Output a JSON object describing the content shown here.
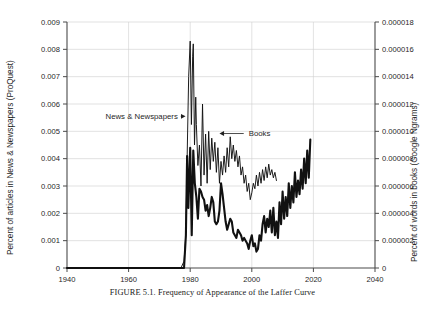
{
  "caption": {
    "lead": "FIGURE 5.1.",
    "text": " Frequency of Appearance of the Laffer Curve"
  },
  "chart_data": {
    "type": "line",
    "title": "Frequency of Appearance of the Laffer Curve",
    "xlabel": "",
    "ylabel": "Percent of articles in News & Newspapers (ProQuest)",
    "y2label": "Percent of words in books (Google Ngrams)",
    "xlim": [
      1940,
      2040
    ],
    "ylim": [
      0,
      0.009
    ],
    "y2lim": [
      0,
      1.8e-05
    ],
    "grid": true,
    "legend_position": "inline-annotations",
    "x_ticks": [
      1940,
      1960,
      1980,
      2000,
      2020,
      2040
    ],
    "x_tick_labels": [
      "1940",
      "1960",
      "1980",
      "2000",
      "2020",
      "2040"
    ],
    "y_ticks": [
      0,
      0.001,
      0.002,
      0.003,
      0.004,
      0.005,
      0.006,
      0.007,
      0.008,
      0.009
    ],
    "y_tick_labels": [
      "0",
      "0.001",
      "0.002",
      "0.003",
      "0.004",
      "0.005",
      "0.006",
      "0.007",
      "0.008",
      "0.009"
    ],
    "y2_ticks": [
      0,
      2e-06,
      4e-06,
      6e-06,
      8e-06,
      1e-05,
      1.2e-05,
      1.4e-05,
      1.6e-05,
      1.8e-05
    ],
    "y2_tick_labels": [
      "0",
      "0.000002",
      "0.000004",
      "0.000006",
      "0.000008",
      "0.000010",
      "0.000012",
      "0.000014",
      "0.000016",
      "0.000018"
    ],
    "annotations": [
      {
        "label": "News & Newspapers",
        "text_x": 1952.5,
        "text_y": 0.00555,
        "arrow_to_x": 1978.5,
        "arrow_to_y": 0.00555
      },
      {
        "label": "Books",
        "text_x": 1999.0,
        "text_y": 0.00492,
        "arrow_to_x": 1989.5,
        "arrow_to_y": 0.00492
      }
    ],
    "series": [
      {
        "name": "News & Newspapers",
        "axis": "left",
        "color": "#111111",
        "width": 2.1,
        "x": [
          1940,
          1945,
          1950,
          1955,
          1960,
          1965,
          1970,
          1974,
          1976,
          1977,
          1978,
          1978.6,
          1979,
          1979.4,
          1980,
          1980.5,
          1981,
          1981.5,
          1982,
          1982.5,
          1983,
          1983.5,
          1984,
          1984.5,
          1985,
          1985.5,
          1986,
          1986.5,
          1987,
          1987.5,
          1988,
          1988.5,
          1989,
          1989.5,
          1990,
          1990.5,
          1991,
          1991.5,
          1992,
          1992.5,
          1993,
          1993.5,
          1994,
          1994.5,
          1995,
          1995.5,
          1996,
          1996.5,
          1997,
          1997.5,
          1998,
          1998.5,
          1999,
          1999.5,
          2000,
          2000.5,
          2001,
          2001.5,
          2002,
          2002.5,
          2003,
          2003.5,
          2004,
          2004.5,
          2005,
          2005.5,
          2006,
          2006.5,
          2007,
          2007.5,
          2008,
          2008.5,
          2009,
          2009.5,
          2010,
          2010.5,
          2011,
          2011.5,
          2012,
          2012.5,
          2013,
          2013.5,
          2014,
          2014.5,
          2015,
          2015.5,
          2016,
          2016.5,
          2017,
          2017.5,
          2018,
          2018.5,
          2019
        ],
        "y": [
          0,
          0,
          0,
          0,
          0,
          0,
          0,
          0,
          0,
          0,
          0,
          0.0012,
          0.0041,
          0.0022,
          0.0044,
          0.0012,
          0.0043,
          0.0031,
          0.0026,
          0.0018,
          0.0029,
          0.0028,
          0.0026,
          0.0025,
          0.0021,
          0.0023,
          0.0019,
          0.0022,
          0.0026,
          0.0024,
          0.0017,
          0.0016,
          0.0017,
          0.0021,
          0.0031,
          0.0027,
          0.0022,
          0.0017,
          0.0014,
          0.0016,
          0.0018,
          0.0017,
          0.0013,
          0.0012,
          0.0011,
          0.0014,
          0.0013,
          0.0012,
          0.001,
          0.0011,
          0.001,
          0.0009,
          0.0007,
          0.001,
          0.0012,
          0.0008,
          0.0009,
          0.0006,
          0.0007,
          0.0012,
          0.001,
          0.0016,
          0.0019,
          0.0013,
          0.0018,
          0.0015,
          0.0021,
          0.0013,
          0.0022,
          0.0012,
          0.0017,
          0.0011,
          0.0024,
          0.0016,
          0.0028,
          0.0018,
          0.0026,
          0.0019,
          0.0031,
          0.0022,
          0.003,
          0.0024,
          0.0035,
          0.0026,
          0.0032,
          0.0027,
          0.0036,
          0.0029,
          0.004,
          0.0031,
          0.0043,
          0.0033,
          0.0047
        ]
      },
      {
        "name": "Books",
        "axis": "right",
        "color": "#111111",
        "width": 0.95,
        "x": [
          1940,
          1950,
          1960,
          1970,
          1975,
          1977,
          1978,
          1978.6,
          1979,
          1979.5,
          1980,
          1980.4,
          1980.8,
          1981,
          1981.4,
          1981.8,
          1982,
          1982.5,
          1983,
          1983.5,
          1984,
          1984.5,
          1985,
          1985.5,
          1986,
          1986.5,
          1987,
          1987.5,
          1988,
          1988.5,
          1989,
          1989.5,
          1990,
          1990.5,
          1991,
          1991.5,
          1992,
          1992.5,
          1993,
          1993.5,
          1994,
          1994.5,
          1995,
          1995.5,
          1996,
          1996.5,
          1997,
          1997.5,
          1998,
          1998.5,
          1999,
          1999.5,
          2000,
          2000.5,
          2001,
          2001.5,
          2002,
          2002.5,
          2003,
          2003.5,
          2004,
          2004.5,
          2005,
          2005.5,
          2006,
          2006.5,
          2007,
          2007.5,
          2008
        ],
        "y": [
          0,
          0,
          0,
          0,
          0,
          0,
          5e-07,
          2.5e-06,
          8e-06,
          1.4e-05,
          1.66e-05,
          1.05e-05,
          1.55e-05,
          1.64e-05,
          9e-06,
          1.25e-05,
          1.05e-05,
          7.5e-06,
          9e-06,
          6e-06,
          1.2e-05,
          6.8e-06,
          9.8e-06,
          6.2e-06,
          1e-05,
          7.2e-06,
          9.5e-06,
          7.8e-06,
          9.2e-06,
          7e-06,
          8.8e-06,
          6.2e-06,
          7.8e-06,
          6.8e-06,
          8.2e-06,
          7e-06,
          8.8e-06,
          7.4e-06,
          9.6e-06,
          8e-06,
          9e-06,
          7.8e-06,
          8.6e-06,
          7.4e-06,
          8.2e-06,
          6.8e-06,
          7.4e-06,
          6.2e-06,
          6.8e-06,
          5.6e-06,
          6.2e-06,
          5e-06,
          5.5e-06,
          6.2e-06,
          5.8e-06,
          6.8e-06,
          6e-06,
          7e-06,
          6.2e-06,
          7.2e-06,
          6.4e-06,
          7.4e-06,
          6.6e-06,
          7.6e-06,
          6.8e-06,
          7.2e-06,
          6.6e-06,
          7e-06,
          6.4e-06
        ]
      }
    ]
  }
}
